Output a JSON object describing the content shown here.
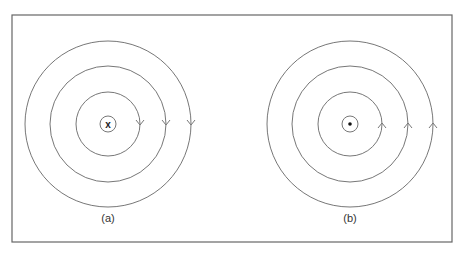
{
  "figure": {
    "frame": {
      "x": 12,
      "y": 15,
      "width": 440,
      "height": 227,
      "stroke": "#666666"
    },
    "line_color": "#777777",
    "panels": [
      {
        "id": "a",
        "label": "(a)",
        "center": {
          "x": 108,
          "y": 124
        },
        "center_symbol": "x",
        "center_symbol_meaning": "current into page",
        "center_ring_radius": 8,
        "field_line_radii": [
          32,
          58,
          83
        ],
        "arrow_direction": "down"
      },
      {
        "id": "b",
        "label": "(b)",
        "center": {
          "x": 350,
          "y": 124
        },
        "center_symbol": "•",
        "center_symbol_meaning": "current out of page",
        "center_ring_radius": 8,
        "field_line_radii": [
          32,
          58,
          83
        ],
        "arrow_direction": "up"
      }
    ]
  }
}
